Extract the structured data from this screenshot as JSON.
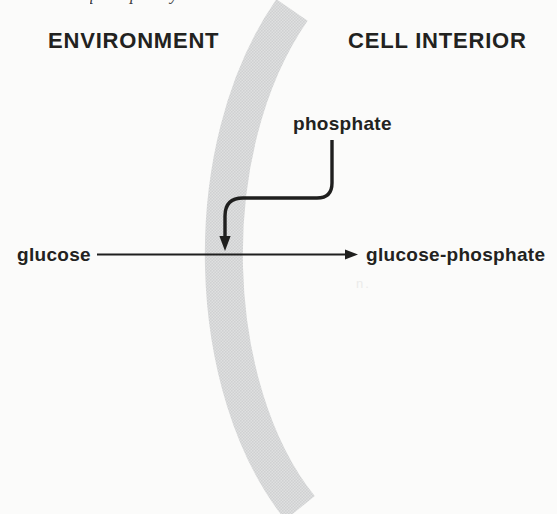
{
  "figure": {
    "caption_fragment": "phosphorylation",
    "region_left": "ENVIRONMENT",
    "region_right": "CELL INTERIOR",
    "phosphate_label": "phosphate",
    "substrate_label": "glucose",
    "product_label": "glucose-phosphate",
    "print_artifact": "n."
  },
  "colors": {
    "ink": "#1f1f1e",
    "membrane_base": "#dfe0e0",
    "membrane_dot": "#cfd0d1"
  }
}
